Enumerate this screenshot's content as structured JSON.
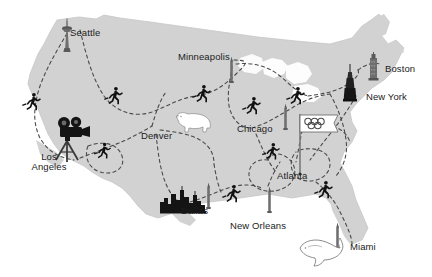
{
  "map": {
    "title": "United States Olympic torch relay route map",
    "region": "United States of America",
    "background_color": "#ffffff",
    "landmass_color": "#d2d2d2",
    "landmass_outline_color": "#bdbdbd",
    "route_line_color": "#4a4a4a",
    "route_line_style": "dashed",
    "figure_color": "#111111",
    "label_color": "#1b1b1b"
  },
  "cities": [
    {
      "id": "seattle",
      "label": "Seattle",
      "x": 70,
      "y": 33,
      "icon": "space-needle-icon",
      "icon_x": 63,
      "icon_y": 20
    },
    {
      "id": "minneapolis",
      "label": "Minneapolis",
      "x": 178,
      "y": 57,
      "icon": "monument-icon",
      "icon_x": 229,
      "icon_y": 58
    },
    {
      "id": "boston",
      "label": "Boston",
      "x": 385,
      "y": 69,
      "icon": "skyscraper-icon",
      "icon_x": 369,
      "icon_y": 55
    },
    {
      "id": "new-york",
      "label": "New York",
      "x": 368,
      "y": 97,
      "icon": "empire-state-icon",
      "icon_x": 349,
      "icon_y": 68
    },
    {
      "id": "denver",
      "label": "Denver",
      "x": 142,
      "y": 136,
      "icon": "bison-icon",
      "icon_x": 176,
      "icon_y": 113
    },
    {
      "id": "chicago",
      "label": "Chicago",
      "x": 238,
      "y": 129,
      "icon": "monument-icon",
      "icon_x": 283,
      "icon_y": 105
    },
    {
      "id": "los-angeles",
      "label": "Los Angeles",
      "x": 28,
      "y": 158,
      "icon": "movie-camera-icon",
      "icon_x": 57,
      "icon_y": 120
    },
    {
      "id": "atlanta",
      "label": "Atlanta",
      "x": 278,
      "y": 176,
      "icon": "olympic-flag-icon",
      "icon_x": 300,
      "icon_y": 118
    },
    {
      "id": "dallas",
      "label": "Dallas",
      "x": 182,
      "y": 210,
      "icon": "skyline-icon",
      "icon_x": 168,
      "icon_y": 185
    },
    {
      "id": "new-orleans",
      "label": "New Orleans",
      "x": 231,
      "y": 225,
      "icon": "monument-icon",
      "icon_x": 268,
      "icon_y": 188
    },
    {
      "id": "miami",
      "label": "Miami",
      "x": 351,
      "y": 246,
      "icon": "dolphin-icon",
      "icon_x": 303,
      "icon_y": 237
    }
  ],
  "icons": [
    {
      "name": "space-needle-icon",
      "city": "seattle"
    },
    {
      "name": "monument-icon",
      "city": "minneapolis"
    },
    {
      "name": "skyscraper-icon",
      "city": "boston"
    },
    {
      "name": "empire-state-icon",
      "city": "new-york"
    },
    {
      "name": "bison-icon",
      "city": "denver"
    },
    {
      "name": "monument-icon",
      "city": "chicago"
    },
    {
      "name": "movie-camera-icon",
      "city": "los-angeles"
    },
    {
      "name": "olympic-flag-icon",
      "city": "atlanta"
    },
    {
      "name": "skyline-icon",
      "city": "dallas"
    },
    {
      "name": "monument-icon",
      "city": "new-orleans"
    },
    {
      "name": "dolphin-icon",
      "city": "miami"
    }
  ],
  "runners": [
    {
      "id": "runner-pacific-northwest",
      "x": 30,
      "y": 100,
      "flip": false
    },
    {
      "id": "runner-idaho",
      "x": 112,
      "y": 93,
      "flip": false
    },
    {
      "id": "runner-montana",
      "x": 200,
      "y": 92,
      "flip": false
    },
    {
      "id": "runner-southwest",
      "x": 100,
      "y": 148,
      "flip": false
    },
    {
      "id": "runner-great-lakes",
      "x": 249,
      "y": 103,
      "flip": false
    },
    {
      "id": "runner-northeast",
      "x": 292,
      "y": 92,
      "flip": false
    },
    {
      "id": "runner-midsouth",
      "x": 268,
      "y": 148,
      "flip": false
    },
    {
      "id": "runner-texas",
      "x": 228,
      "y": 190,
      "flip": false
    },
    {
      "id": "runner-southeast",
      "x": 320,
      "y": 185,
      "flip": false
    }
  ],
  "legend": {
    "route_description": "Dashed lines indicate relay route segments between host cities"
  }
}
